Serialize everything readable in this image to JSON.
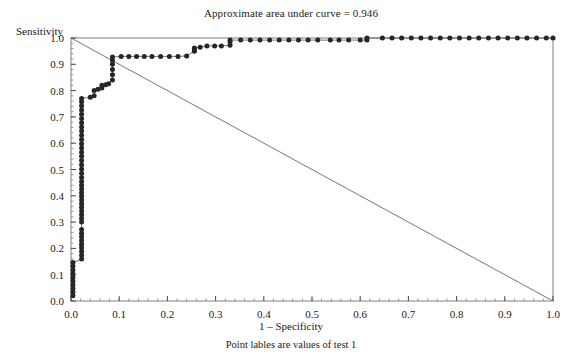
{
  "chart_data": {
    "type": "line",
    "title": "Approximate area under curve = 0.946",
    "xlabel": "1 – Specificity",
    "ylabel": "Sensitivity",
    "footnote": "Point lables are values of test 1",
    "auc": 0.946,
    "xlim": [
      0.0,
      1.0
    ],
    "ylim": [
      0.0,
      1.0
    ],
    "xticks": [
      "0.0",
      "0.1",
      "0.2",
      "0.3",
      "0.4",
      "0.5",
      "0.6",
      "0.7",
      "0.8",
      "0.9",
      "1.0"
    ],
    "yticks": [
      "0.0",
      "0.1",
      "0.2",
      "0.3",
      "0.4",
      "0.5",
      "0.6",
      "0.7",
      "0.8",
      "0.9",
      "1.0"
    ],
    "xtick_values": [
      0.0,
      0.1,
      0.2,
      0.3,
      0.4,
      0.5,
      0.6,
      0.7,
      0.8,
      0.9,
      1.0
    ],
    "ytick_values": [
      0.0,
      0.1,
      0.2,
      0.3,
      0.4,
      0.5,
      0.6,
      0.7,
      0.8,
      0.9,
      1.0
    ],
    "minor_tick_step": 0.02,
    "grid": false,
    "legend": null,
    "marker": "filled-circle",
    "marker_color": "#262626",
    "line_color": "#555555",
    "reference_line": {
      "name": "descending-diagonal",
      "x": [
        0.0,
        1.0
      ],
      "y": [
        1.0,
        0.0
      ],
      "color": "#666666"
    },
    "series": [
      {
        "name": "ROC curve of test 1",
        "points": [
          [
            0.004,
            0.02
          ],
          [
            0.004,
            0.034
          ],
          [
            0.004,
            0.048
          ],
          [
            0.004,
            0.062
          ],
          [
            0.004,
            0.076
          ],
          [
            0.004,
            0.09
          ],
          [
            0.004,
            0.104
          ],
          [
            0.004,
            0.118
          ],
          [
            0.004,
            0.132
          ],
          [
            0.004,
            0.146
          ],
          [
            0.022,
            0.16
          ],
          [
            0.022,
            0.174
          ],
          [
            0.022,
            0.188
          ],
          [
            0.022,
            0.202
          ],
          [
            0.022,
            0.216
          ],
          [
            0.022,
            0.23
          ],
          [
            0.022,
            0.244
          ],
          [
            0.022,
            0.258
          ],
          [
            0.022,
            0.272
          ],
          [
            0.022,
            0.3
          ],
          [
            0.022,
            0.314
          ],
          [
            0.022,
            0.328
          ],
          [
            0.022,
            0.342
          ],
          [
            0.022,
            0.356
          ],
          [
            0.022,
            0.37
          ],
          [
            0.022,
            0.384
          ],
          [
            0.022,
            0.398
          ],
          [
            0.022,
            0.412
          ],
          [
            0.022,
            0.426
          ],
          [
            0.022,
            0.44
          ],
          [
            0.022,
            0.454
          ],
          [
            0.022,
            0.47
          ],
          [
            0.022,
            0.486
          ],
          [
            0.022,
            0.502
          ],
          [
            0.022,
            0.518
          ],
          [
            0.022,
            0.534
          ],
          [
            0.022,
            0.55
          ],
          [
            0.022,
            0.566
          ],
          [
            0.022,
            0.582
          ],
          [
            0.022,
            0.598
          ],
          [
            0.022,
            0.614
          ],
          [
            0.022,
            0.63
          ],
          [
            0.022,
            0.646
          ],
          [
            0.022,
            0.662
          ],
          [
            0.022,
            0.678
          ],
          [
            0.022,
            0.694
          ],
          [
            0.022,
            0.71
          ],
          [
            0.022,
            0.726
          ],
          [
            0.022,
            0.742
          ],
          [
            0.022,
            0.758
          ],
          [
            0.022,
            0.77
          ],
          [
            0.04,
            0.775
          ],
          [
            0.048,
            0.78
          ],
          [
            0.048,
            0.8
          ],
          [
            0.056,
            0.805
          ],
          [
            0.064,
            0.81
          ],
          [
            0.064,
            0.82
          ],
          [
            0.072,
            0.822
          ],
          [
            0.078,
            0.826
          ],
          [
            0.086,
            0.84
          ],
          [
            0.086,
            0.86
          ],
          [
            0.086,
            0.88
          ],
          [
            0.086,
            0.9
          ],
          [
            0.086,
            0.915
          ],
          [
            0.086,
            0.928
          ],
          [
            0.104,
            0.93
          ],
          [
            0.12,
            0.93
          ],
          [
            0.136,
            0.93
          ],
          [
            0.152,
            0.93
          ],
          [
            0.168,
            0.93
          ],
          [
            0.186,
            0.93
          ],
          [
            0.204,
            0.93
          ],
          [
            0.222,
            0.93
          ],
          [
            0.24,
            0.932
          ],
          [
            0.256,
            0.95
          ],
          [
            0.256,
            0.958
          ],
          [
            0.256,
            0.962
          ],
          [
            0.268,
            0.965
          ],
          [
            0.282,
            0.97
          ],
          [
            0.298,
            0.97
          ],
          [
            0.312,
            0.97
          ],
          [
            0.33,
            0.972
          ],
          [
            0.33,
            0.985
          ],
          [
            0.33,
            0.992
          ],
          [
            0.352,
            0.992
          ],
          [
            0.372,
            0.992
          ],
          [
            0.392,
            0.992
          ],
          [
            0.412,
            0.992
          ],
          [
            0.432,
            0.992
          ],
          [
            0.452,
            0.992
          ],
          [
            0.472,
            0.992
          ],
          [
            0.492,
            0.992
          ],
          [
            0.512,
            0.992
          ],
          [
            0.538,
            0.992
          ],
          [
            0.556,
            0.992
          ],
          [
            0.576,
            0.992
          ],
          [
            0.6,
            0.992
          ],
          [
            0.614,
            0.992
          ],
          [
            0.614,
            1.0
          ],
          [
            0.646,
            1.0
          ],
          [
            0.666,
            1.0
          ],
          [
            0.686,
            1.0
          ],
          [
            0.706,
            1.0
          ],
          [
            0.726,
            1.0
          ],
          [
            0.746,
            1.0
          ],
          [
            0.766,
            1.0
          ],
          [
            0.786,
            1.0
          ],
          [
            0.806,
            1.0
          ],
          [
            0.826,
            1.0
          ],
          [
            0.846,
            1.0
          ],
          [
            0.866,
            1.0
          ],
          [
            0.886,
            1.0
          ],
          [
            0.906,
            1.0
          ],
          [
            0.926,
            1.0
          ],
          [
            0.946,
            1.0
          ],
          [
            0.966,
            1.0
          ],
          [
            0.986,
            1.0
          ],
          [
            1.0,
            1.0
          ]
        ]
      }
    ]
  },
  "plot_geometry": {
    "left": 71,
    "right": 553,
    "top": 38,
    "bottom": 301
  }
}
